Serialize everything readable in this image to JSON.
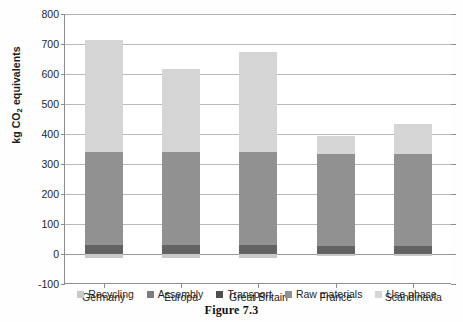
{
  "caption": "Figure 7.3",
  "chart_data": {
    "type": "bar",
    "subtype": "stacked-vertical",
    "title": "",
    "xlabel": "",
    "ylabel": "kg CO2 equivalents",
    "ylabel_parts": {
      "pre": "kg CO",
      "sub": "2",
      "post": " equivalents"
    },
    "categories": [
      "Germany",
      "Europa",
      "Great Britain",
      "France",
      "Scandinavia"
    ],
    "ylim": [
      -100,
      800
    ],
    "yticks": [
      800,
      700,
      600,
      500,
      400,
      300,
      200,
      100,
      0,
      -100
    ],
    "ytick_labels": [
      "800",
      "700",
      "600",
      "500",
      "400",
      "300",
      "200",
      "100",
      "0",
      "-100"
    ],
    "grid": true,
    "legend_position": "bottom",
    "series": [
      {
        "name": "Recycling",
        "color": "#c9c9c9",
        "values": [
          -12,
          -12,
          -12,
          -6,
          -6
        ]
      },
      {
        "name": "Assembly",
        "color": "#7d7d7d",
        "values": [
          0,
          0,
          0,
          0,
          0
        ]
      },
      {
        "name": "Transport",
        "color": "#636363",
        "values": [
          30,
          30,
          30,
          28,
          28
        ]
      },
      {
        "name": "Raw materials",
        "color": "#919191",
        "values": [
          310,
          310,
          310,
          305,
          305
        ]
      },
      {
        "name": "Use phase",
        "color": "#d5d5d5",
        "values": [
          372,
          278,
          332,
          62,
          102
        ]
      }
    ],
    "totals": [
      712,
      618,
      672,
      395,
      435
    ]
  },
  "legend": {
    "items": [
      {
        "label": "Recycling",
        "color": "#c9c9c9"
      },
      {
        "label": "Assembly",
        "color": "#7d7d7d"
      },
      {
        "label": "Transport",
        "color": "#4f4f4f"
      },
      {
        "label": "Raw materials",
        "color": "#919191"
      },
      {
        "label": "Use phase",
        "color": "#d5d5d5"
      }
    ]
  }
}
